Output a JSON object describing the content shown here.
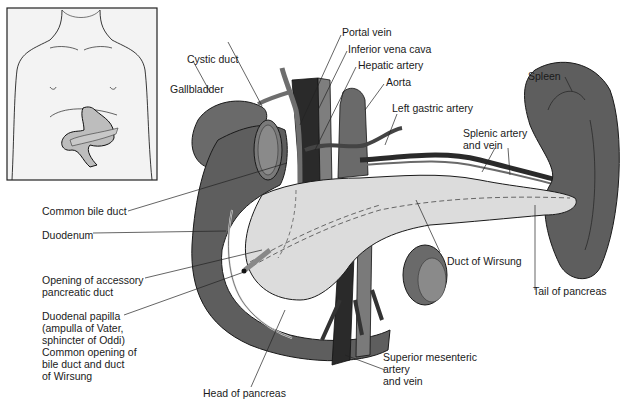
{
  "diagram": {
    "colors": {
      "organ_dark": "#5e5e5e",
      "organ_mid": "#7a7a7a",
      "pancreas": "#dcdcdc",
      "vein_dark": "#2a2a2a",
      "artery": "#8a8a8a",
      "outline": "#1a1a1a",
      "inset_bg": "#f3f3f3",
      "inset_organ": "#bdbdbd"
    },
    "inset": {
      "label": "Body outline with location of stomach and pancreas"
    },
    "labels": {
      "portal_vein": "Portal vein",
      "inferior_vena_cava": "Inferior vena cava",
      "hepatic_artery": "Hepatic artery",
      "aorta": "Aorta",
      "cystic_duct": "Cystic duct",
      "gallbladder": "Gallbladder",
      "left_gastric_artery": "Left gastric artery",
      "spleen": "Spleen",
      "splenic_artery_vein": "Splenic artery\nand vein",
      "common_bile_duct": "Common bile duct",
      "duodenum": "Duodenum",
      "opening_accessory_duct": "Opening of accessory\npancreatic duct",
      "duodenal_papilla": "Duodenal papilla\n(ampulla of Vater,\nsphincter of Oddi)\nCommon opening of\nbile duct and duct\nof Wirsung",
      "duct_of_wirsung": "Duct of Wirsung",
      "tail_of_pancreas": "Tail of pancreas",
      "superior_mesenteric": "Superior mesenteric\nartery\nand vein",
      "head_of_pancreas": "Head of pancreas"
    }
  }
}
